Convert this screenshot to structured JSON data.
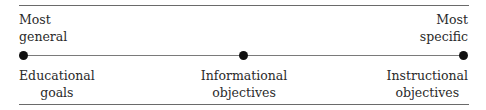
{
  "diagram": {
    "endpoints": {
      "left": {
        "line1": "Most",
        "line2": "general"
      },
      "right": {
        "line1": "Most",
        "line2": "specific"
      }
    },
    "points": [
      {
        "line1": "Educational",
        "line2": "goals"
      },
      {
        "line1": "Informational",
        "line2": "objectives"
      },
      {
        "line1": "Instructional",
        "line2": "objectives"
      }
    ]
  }
}
